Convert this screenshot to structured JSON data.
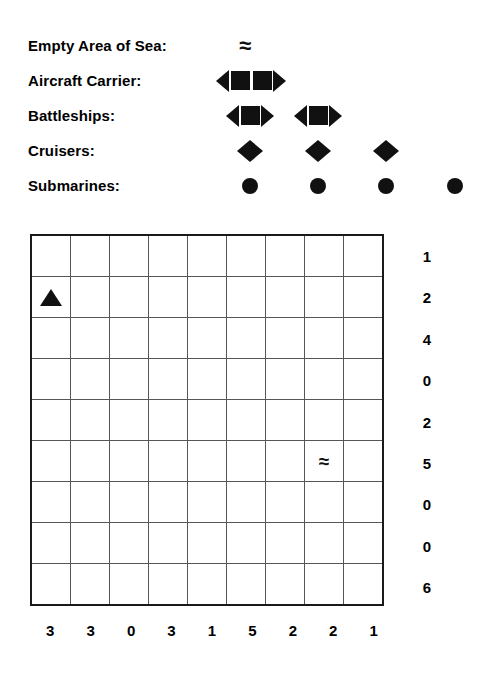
{
  "legend": {
    "rows": [
      {
        "label": "Empty Area of Sea:",
        "icon": "water-wave-icon",
        "type": "water",
        "count": 1,
        "length": 0,
        "positions": [
          245
        ]
      },
      {
        "label": "Aircraft Carrier:",
        "icon": "ship-icon",
        "type": "ship",
        "count": 1,
        "length": 4,
        "positions": [
          251
        ]
      },
      {
        "label": "Battleships:",
        "icon": "ship-icon",
        "type": "ship",
        "count": 2,
        "length": 3,
        "positions": [
          250,
          318
        ]
      },
      {
        "label": "Cruisers:",
        "icon": "ship-icon",
        "type": "ship",
        "count": 3,
        "length": 2,
        "positions": [
          250,
          318,
          386
        ]
      },
      {
        "label": "Submarines:",
        "icon": "submarine-dot-icon",
        "type": "sub",
        "count": 4,
        "length": 1,
        "positions": [
          250,
          318,
          386,
          455
        ]
      }
    ]
  },
  "board": {
    "rows": 9,
    "cols": 9,
    "row_clues": [
      "1",
      "2",
      "4",
      "0",
      "2",
      "5",
      "0",
      "0",
      "6"
    ],
    "col_clues": [
      "3",
      "3",
      "0",
      "3",
      "1",
      "5",
      "2",
      "2",
      "1"
    ],
    "cells": [
      [
        "",
        "",
        "",
        "",
        "",
        "",
        "",
        "",
        ""
      ],
      [
        "triangle-up",
        "",
        "",
        "",
        "",
        "",
        "",
        "",
        ""
      ],
      [
        "",
        "",
        "",
        "",
        "",
        "",
        "",
        "",
        ""
      ],
      [
        "",
        "",
        "",
        "",
        "",
        "",
        "",
        "",
        ""
      ],
      [
        "",
        "",
        "",
        "",
        "",
        "",
        "",
        "",
        ""
      ],
      [
        "",
        "",
        "",
        "",
        "",
        "",
        "",
        "water",
        ""
      ],
      [
        "",
        "",
        "",
        "",
        "",
        "",
        "",
        "",
        ""
      ],
      [
        "",
        "",
        "",
        "",
        "",
        "",
        "",
        "",
        ""
      ],
      [
        "",
        "",
        "",
        "",
        "",
        "",
        "",
        "",
        ""
      ]
    ],
    "glyphs": {
      "water": "≈"
    }
  },
  "colors": {
    "ink": "#111111",
    "grid_line": "#555555",
    "grid_border": "#1a1a1a",
    "background": "#ffffff"
  }
}
